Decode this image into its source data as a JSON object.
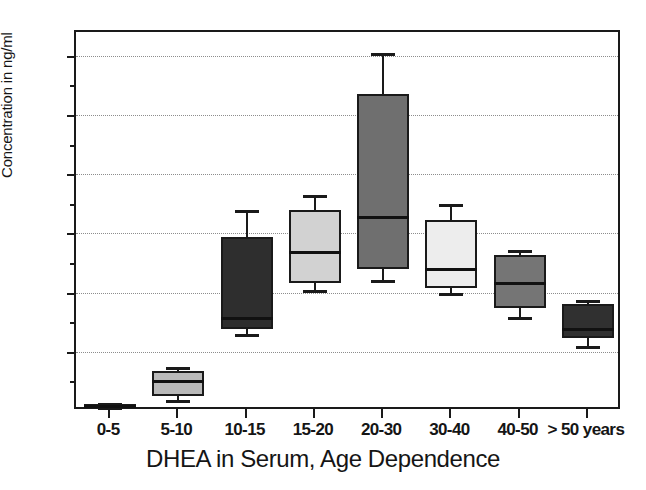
{
  "chart_data": {
    "type": "box",
    "title": "DHEA in Serum, Age Dependence",
    "xlabel": "",
    "ylabel": "Concentration in ng/ml",
    "ylim": [
      0,
      32
    ],
    "yticks_major": [
      5,
      10,
      15,
      20,
      25,
      30
    ],
    "yticks_minor": [
      2.5,
      7.5,
      12.5,
      17.5,
      22.5,
      27.5
    ],
    "ytick_labels": [
      "5",
      "10",
      "15",
      "20",
      "25",
      "30"
    ],
    "grid": "horizontal-dotted",
    "legend": "none",
    "categories": [
      "0-5",
      "5-10",
      "10-15",
      "15-20",
      "20-30",
      "30-40",
      "40-50",
      "> 50 years"
    ],
    "boxes": [
      {
        "category": "0-5",
        "whisker_low": 0.3,
        "q1": 0.4,
        "median": 0.5,
        "q3": 0.6,
        "whisker_high": 0.7,
        "fill": "#262626"
      },
      {
        "category": "5-10",
        "whisker_low": 0.9,
        "q1": 1.3,
        "median": 2.6,
        "q3": 3.4,
        "whisker_high": 3.7,
        "fill": "#b9b9b9"
      },
      {
        "category": "10-15",
        "whisker_low": 6.5,
        "q1": 6.9,
        "median": 7.9,
        "q3": 14.7,
        "whisker_high": 17.0,
        "fill": "#2e2e2e"
      },
      {
        "category": "15-20",
        "whisker_low": 10.2,
        "q1": 10.8,
        "median": 13.5,
        "q3": 17.0,
        "whisker_high": 18.2,
        "fill": "#d2d2d2"
      },
      {
        "category": "20-30",
        "whisker_low": 11.1,
        "q1": 12.0,
        "median": 16.5,
        "q3": 26.8,
        "whisker_high": 30.2,
        "fill": "#6f6f6f"
      },
      {
        "category": "30-40",
        "whisker_low": 10.0,
        "q1": 10.4,
        "median": 12.1,
        "q3": 16.1,
        "whisker_high": 17.5,
        "fill": "#ededed"
      },
      {
        "category": "40-50",
        "whisker_low": 7.9,
        "q1": 8.7,
        "median": 10.9,
        "q3": 13.2,
        "whisker_high": 13.6,
        "fill": "#757575"
      },
      {
        "category": "> 50 years",
        "whisker_low": 5.5,
        "q1": 6.2,
        "median": 7.0,
        "q3": 9.0,
        "whisker_high": 9.4,
        "fill": "#303030"
      }
    ]
  },
  "colors": {
    "axis": "#1a1a1a",
    "grid": "#8d8d8d",
    "text": "#151515",
    "background": "#ffffff"
  }
}
